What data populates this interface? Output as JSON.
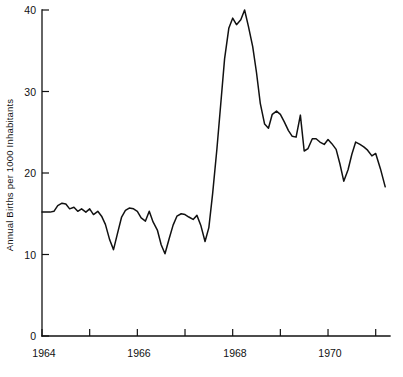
{
  "chart_data": {
    "type": "line",
    "title": "",
    "xlabel": "",
    "ylabel": "Annual Births per 1000 Inhabitants",
    "xlim": [
      1964.0,
      1971.3
    ],
    "ylim": [
      0,
      40
    ],
    "grid": false,
    "legend": null,
    "y_ticks": [
      0,
      10,
      20,
      30,
      40
    ],
    "y_tick_labels": [
      "0",
      "10",
      "20",
      "30",
      "40"
    ],
    "y_minor_ticks": [],
    "x_ticks": [
      1964,
      1965,
      1966,
      1967,
      1968,
      1969,
      1970,
      1971
    ],
    "x_tick_labels_shown": [
      "1964",
      "",
      "1966",
      "",
      "1968",
      "",
      "1970",
      ""
    ],
    "x_labeled_ticks": [
      {
        "value": 1964,
        "label": "1964"
      },
      {
        "value": 1966,
        "label": "1966"
      },
      {
        "value": 1968,
        "label": "1968"
      },
      {
        "value": 1970,
        "label": "1970"
      }
    ],
    "series": [
      {
        "name": "Annual Births per 1000 Inhabitants",
        "color": "#111111",
        "x": [
          1964.0,
          1964.08,
          1964.17,
          1964.25,
          1964.33,
          1964.42,
          1964.5,
          1964.58,
          1964.67,
          1964.75,
          1964.83,
          1964.92,
          1965.0,
          1965.08,
          1965.17,
          1965.25,
          1965.33,
          1965.42,
          1965.5,
          1965.58,
          1965.67,
          1965.75,
          1965.83,
          1965.92,
          1966.0,
          1966.08,
          1966.17,
          1966.25,
          1966.33,
          1966.42,
          1966.5,
          1966.58,
          1966.67,
          1966.75,
          1966.83,
          1966.92,
          1967.0,
          1967.08,
          1967.17,
          1967.25,
          1967.33,
          1967.42,
          1967.5,
          1967.58,
          1967.67,
          1967.75,
          1967.83,
          1967.92,
          1968.0,
          1968.08,
          1968.17,
          1968.25,
          1968.33,
          1968.42,
          1968.5,
          1968.58,
          1968.67,
          1968.75,
          1968.83,
          1968.92,
          1969.0,
          1969.08,
          1969.17,
          1969.25,
          1969.33,
          1969.42,
          1969.5,
          1969.58,
          1969.67,
          1969.75,
          1969.83,
          1969.92,
          1970.0,
          1970.08,
          1970.17,
          1970.25,
          1970.33,
          1970.42,
          1970.5,
          1970.58,
          1970.67,
          1970.75,
          1970.83,
          1970.92,
          1971.0,
          1971.1,
          1971.2
        ],
        "y": [
          15.2,
          15.2,
          15.2,
          15.3,
          16.0,
          16.3,
          16.2,
          15.6,
          15.8,
          15.3,
          15.6,
          15.2,
          15.6,
          14.9,
          15.3,
          14.7,
          13.7,
          11.8,
          10.6,
          12.5,
          14.6,
          15.4,
          15.7,
          15.6,
          15.3,
          14.5,
          14.1,
          15.3,
          14.0,
          13.0,
          11.2,
          10.1,
          12.0,
          13.6,
          14.7,
          15.0,
          14.9,
          14.6,
          14.3,
          14.8,
          13.6,
          11.6,
          13.3,
          17.5,
          23.0,
          28.5,
          34.0,
          37.8,
          39.0,
          38.2,
          38.8,
          40.0,
          38.0,
          35.5,
          32.3,
          28.5,
          26.0,
          25.5,
          27.2,
          27.6,
          27.2,
          26.3,
          25.2,
          24.5,
          24.4,
          27.1,
          22.7,
          23.0,
          24.2,
          24.2,
          23.8,
          23.5,
          24.1,
          23.6,
          22.9,
          21.1,
          19.0,
          20.4,
          22.3,
          23.8,
          23.5,
          23.2,
          22.8,
          22.1,
          22.4,
          20.5,
          18.3
        ]
      }
    ]
  },
  "axis": {
    "y_title": "Annual Births per 1000 Inhabitants"
  }
}
